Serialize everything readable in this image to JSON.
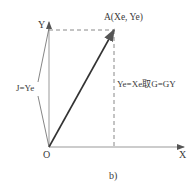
{
  "diagram": {
    "caption": "b)",
    "axes": {
      "x_label": "X",
      "y_label": "Y",
      "origin_label": "O"
    },
    "point_a": {
      "label": "A(Xe, Ye)"
    },
    "annotations": {
      "left": "J=Ye",
      "right": "Ye=Xe取G=GY"
    },
    "colors": {
      "line": "#333333",
      "axis": "#999999",
      "dashed": "#888888"
    }
  }
}
